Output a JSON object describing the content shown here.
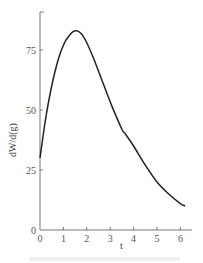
{
  "chart_data": {
    "type": "line",
    "title": "",
    "xlabel": "t",
    "ylabel": "dW/d(g)",
    "xlim": [
      0,
      6.4
    ],
    "ylim": [
      0,
      90
    ],
    "xticks": [
      0,
      1,
      2,
      3,
      4,
      5,
      6
    ],
    "yticks": [
      0,
      25,
      50,
      75
    ],
    "grid": false,
    "legend": null,
    "series": [
      {
        "name": "dW/d(g)",
        "x": [
          0,
          0.25,
          0.5,
          0.75,
          1.0,
          1.25,
          1.5,
          1.75,
          2.0,
          2.35,
          2.7,
          3.1,
          3.5,
          3.65,
          4.0,
          4.5,
          5.0,
          5.5,
          6.0,
          6.2
        ],
        "values": [
          30,
          47,
          60,
          70,
          77,
          81,
          83,
          82,
          78,
          70,
          61,
          51,
          42,
          40,
          35,
          27,
          20,
          15,
          11,
          10
        ]
      }
    ]
  },
  "axes": {
    "x_label": "t",
    "y_label": "dW/d(g)",
    "x_tick_labels": [
      "0",
      "1",
      "2",
      "3",
      "4",
      "5",
      "6"
    ],
    "y_tick_labels": [
      "0",
      "25",
      "50",
      "75"
    ],
    "line_color": "#222222",
    "axis_color": "#777777"
  }
}
